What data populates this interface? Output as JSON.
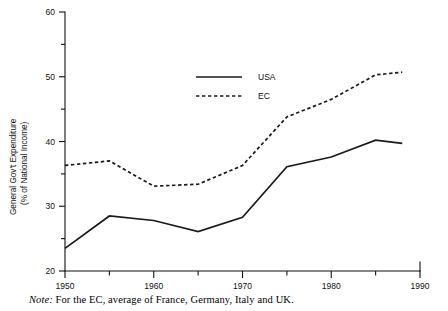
{
  "chart_data": {
    "type": "line",
    "title": "",
    "xlabel": "",
    "ylabel": "General Gov't Expenditure\n(% of National Income)",
    "ylabel_line1": "General Gov't Expenditure",
    "ylabel_line2": "(% of National Income)",
    "x": [
      1950,
      1955,
      1960,
      1965,
      1970,
      1975,
      1980,
      1985,
      1988
    ],
    "xlim": [
      1950,
      1990
    ],
    "ylim": [
      20,
      60
    ],
    "grid": false,
    "legend_position": "upper-center",
    "x_major_ticks": [
      1950,
      1960,
      1970,
      1980,
      1990
    ],
    "x_minor_ticks": [
      1955,
      1965,
      1975,
      1985
    ],
    "x_tick_labels": [
      "1950",
      "1960",
      "1970",
      "1980",
      "1990"
    ],
    "y_major_ticks": [
      20,
      30,
      40,
      50,
      60
    ],
    "y_minor_ticks": [
      25,
      35,
      45,
      55
    ],
    "y_tick_labels": [
      "20",
      "30",
      "40",
      "50",
      "60"
    ],
    "series": [
      {
        "name": "USA",
        "style": "solid",
        "color": "#1a1a1a",
        "values": [
          23.5,
          28.5,
          27.8,
          26.1,
          28.3,
          36.1,
          37.6,
          40.2,
          39.7
        ]
      },
      {
        "name": "EC",
        "style": "dashed",
        "color": "#1a1a1a",
        "values": [
          36.3,
          37.0,
          33.1,
          33.4,
          36.3,
          43.8,
          46.5,
          50.3,
          50.7
        ]
      }
    ]
  },
  "legend": {
    "items": [
      {
        "label": "USA",
        "style": "solid"
      },
      {
        "label": "EC",
        "style": "dashed"
      }
    ]
  },
  "note": {
    "lead": "Note:",
    "text": "For the EC, average of France, Germany, Italy and UK."
  }
}
